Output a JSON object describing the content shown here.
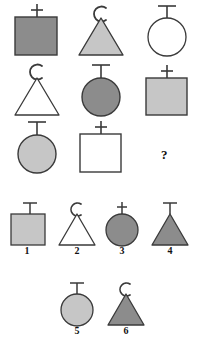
{
  "puzzle": {
    "type": "matrix-reasoning",
    "question_mark": "?",
    "colors": {
      "dark_gray": "#8c8c8c",
      "light_gray": "#c6c6c6",
      "white": "#ffffff",
      "outline": "#3a3a3a",
      "text": "#111111",
      "background": "#ffffff"
    },
    "matrix": {
      "rows": 3,
      "cols": 3,
      "cells": [
        {
          "id": "r1c1",
          "shape": "square",
          "fill": "dark_gray",
          "topper": "plus",
          "topper_label": "+",
          "position": "row 1, column 1"
        },
        {
          "id": "r1c2",
          "shape": "triangle",
          "fill": "light_gray",
          "topper": "arc-c",
          "topper_label": "C",
          "position": "row 1, column 2"
        },
        {
          "id": "r1c3",
          "shape": "circle",
          "fill": "white",
          "topper": "tee",
          "topper_label": "T",
          "position": "row 1, column 3"
        },
        {
          "id": "r2c1",
          "shape": "triangle",
          "fill": "white",
          "topper": "arc-c",
          "topper_label": "C",
          "position": "row 2, column 1"
        },
        {
          "id": "r2c2",
          "shape": "circle",
          "fill": "dark_gray",
          "topper": "tee",
          "topper_label": "T",
          "position": "row 2, column 2"
        },
        {
          "id": "r2c3",
          "shape": "square",
          "fill": "light_gray",
          "topper": "plus",
          "topper_label": "+",
          "position": "row 2, column 3"
        },
        {
          "id": "r3c1",
          "shape": "circle",
          "fill": "light_gray",
          "topper": "tee",
          "topper_label": "T",
          "position": "row 3, column 1"
        },
        {
          "id": "r3c2",
          "shape": "square",
          "fill": "white",
          "topper": "plus",
          "topper_label": "+",
          "position": "row 3, column 2"
        },
        {
          "id": "r3c3",
          "shape": "missing",
          "fill": "none",
          "topper": "none",
          "topper_label": "?",
          "position": "row 3, column 3"
        }
      ]
    },
    "options": [
      {
        "number": "1",
        "shape": "square",
        "fill": "light_gray",
        "topper": "tee",
        "topper_label": "T"
      },
      {
        "number": "2",
        "shape": "triangle",
        "fill": "white",
        "topper": "arc-c",
        "topper_label": "C"
      },
      {
        "number": "3",
        "shape": "circle",
        "fill": "dark_gray",
        "topper": "plus",
        "topper_label": "+"
      },
      {
        "number": "4",
        "shape": "triangle",
        "fill": "dark_gray",
        "topper": "tee",
        "topper_label": "T"
      },
      {
        "number": "5",
        "shape": "circle",
        "fill": "light_gray",
        "topper": "tee",
        "topper_label": "T"
      },
      {
        "number": "6",
        "shape": "triangle",
        "fill": "dark_gray",
        "topper": "arc-c",
        "topper_label": "C"
      }
    ]
  }
}
